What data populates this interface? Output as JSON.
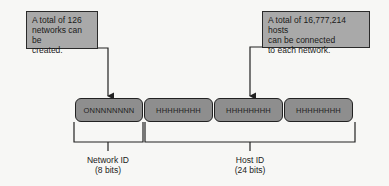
{
  "callouts": {
    "network": {
      "lines": [
        "A total of 126",
        "networks can be",
        "created."
      ]
    },
    "host": {
      "lines": [
        "A total of 16,777,214 hosts",
        "can be connected",
        "to each network."
      ]
    }
  },
  "octets": [
    {
      "label": "ONNNNNNNN",
      "role": "network"
    },
    {
      "label": "HHHHHHHH",
      "role": "host"
    },
    {
      "label": "HHHHHHHH",
      "role": "host"
    },
    {
      "label": "HHHHHHHH",
      "role": "host"
    }
  ],
  "labels": {
    "network": {
      "title": "Network ID",
      "bits": "(8 bits)"
    },
    "host": {
      "title": "Host ID",
      "bits": "(24 bits)"
    }
  },
  "colors": {
    "box_fill": "#8e8e8e",
    "callout_fill": "#a9a9a9",
    "line": "#222222"
  }
}
